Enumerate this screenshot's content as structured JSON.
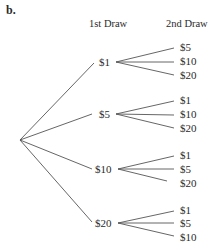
{
  "part_label": "b.",
  "headers": {
    "first": "1st Draw",
    "second": "2nd Draw"
  },
  "tree": {
    "root": "",
    "branches": [
      {
        "label": "$1",
        "children": [
          "$5",
          "$10",
          "$20"
        ]
      },
      {
        "label": "$5",
        "children": [
          "$1",
          "$10",
          "$20"
        ]
      },
      {
        "label": "$10",
        "children": [
          "$1",
          "$5",
          "$20"
        ]
      },
      {
        "label": "$20",
        "children": [
          "$1",
          "$5",
          "$10"
        ]
      }
    ]
  }
}
